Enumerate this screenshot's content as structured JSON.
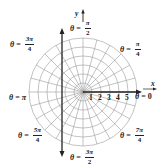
{
  "diagram": {
    "type": "polar-coordinate-grid",
    "axes": {
      "x_label": "x",
      "y_label": "y"
    },
    "radial_ticks": [
      "1",
      "2",
      "3",
      "4",
      "5"
    ],
    "angle_labels": {
      "zero": {
        "theta": "θ",
        "eq": "=",
        "value": "0"
      },
      "pi_over_4": {
        "theta": "θ",
        "eq": "=",
        "num": "π",
        "den": "4"
      },
      "pi_over_2": {
        "theta": "θ",
        "eq": "=",
        "num": "π",
        "den": "2"
      },
      "3pi_over_4": {
        "theta": "θ",
        "eq": "=",
        "num": "3π",
        "den": "4"
      },
      "pi": {
        "theta": "θ",
        "eq": "=",
        "value": "π"
      },
      "5pi_over_4": {
        "theta": "θ",
        "eq": "=",
        "num": "5π",
        "den": "4"
      },
      "3pi_over_2": {
        "theta": "θ",
        "eq": "=",
        "num": "3π",
        "den": "2"
      },
      "7pi_over_4": {
        "theta": "θ",
        "eq": "=",
        "num": "7π",
        "den": "4"
      }
    },
    "grid": {
      "circle_count": 6,
      "radial_line_step_degrees": 15,
      "grid_color": "#9a9a9a",
      "axis_color": "#222222"
    }
  }
}
